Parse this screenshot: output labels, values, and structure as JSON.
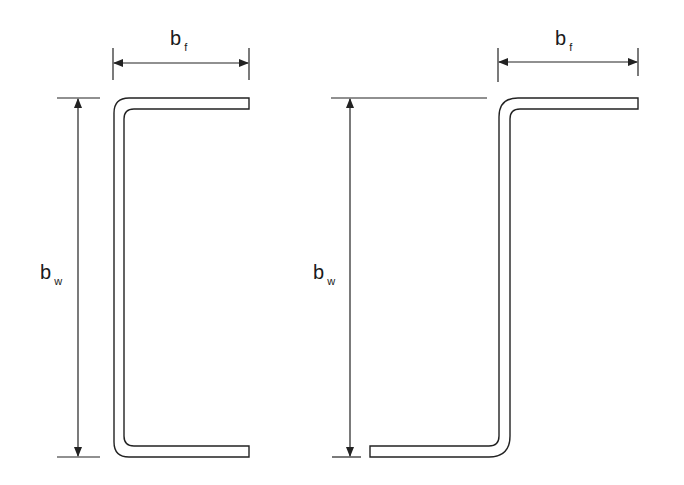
{
  "diagram": {
    "type": "cross-section profiles",
    "stroke_color": "#222222",
    "background": "#ffffff",
    "left_profile": {
      "name": "C-section",
      "flange_label": {
        "main": "b",
        "sub": "f"
      },
      "web_label": {
        "main": "b",
        "sub": "w"
      }
    },
    "right_profile": {
      "name": "Z-section",
      "flange_label": {
        "main": "b",
        "sub": "f"
      },
      "web_label": {
        "main": "b",
        "sub": "w"
      }
    }
  }
}
